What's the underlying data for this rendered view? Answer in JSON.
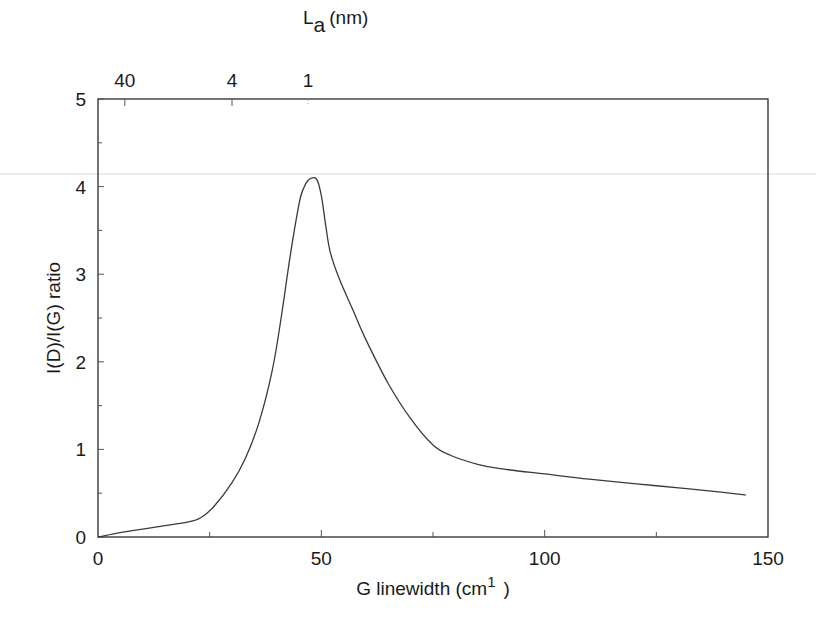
{
  "chart_data": {
    "type": "line",
    "title": "",
    "xlabel": "G linewidth (cm⁻¹)",
    "xlabel_main": "G linewidth (cm",
    "xlabel_sup": "1",
    "xlabel_close": ")",
    "ylabel": "I(D)/I(G) ratio",
    "top_xlabel_main": "L",
    "top_xlabel_sub": "a",
    "top_xlabel_unit": "(nm)",
    "xlim": [
      0,
      150
    ],
    "ylim": [
      0,
      5
    ],
    "grid": false,
    "legend": null,
    "x_ticks": [
      "0",
      "50",
      "100",
      "150"
    ],
    "y_ticks": [
      "0",
      "1",
      "2",
      "3",
      "4",
      "5"
    ],
    "top_ticks": [
      {
        "label": "40",
        "x": 6
      },
      {
        "label": "4",
        "x": 30
      },
      {
        "label": "1",
        "x": 47
      }
    ],
    "series": [
      {
        "name": "I(D)/I(G) vs G linewidth",
        "x": [
          0,
          5,
          10,
          15,
          20,
          23,
          26,
          30,
          33,
          36,
          39,
          41,
          43,
          45,
          46,
          47,
          48,
          49,
          50,
          51,
          52,
          54,
          57,
          60,
          65,
          70,
          75,
          79,
          85,
          90,
          100,
          110,
          120,
          130,
          140,
          145
        ],
        "y": [
          0.0,
          0.05,
          0.09,
          0.13,
          0.17,
          0.22,
          0.35,
          0.62,
          0.9,
          1.3,
          1.9,
          2.5,
          3.2,
          3.8,
          3.98,
          4.07,
          4.1,
          4.08,
          3.9,
          3.55,
          3.25,
          2.95,
          2.6,
          2.25,
          1.75,
          1.35,
          1.05,
          0.93,
          0.83,
          0.78,
          0.72,
          0.66,
          0.61,
          0.56,
          0.51,
          0.48
        ]
      }
    ]
  }
}
